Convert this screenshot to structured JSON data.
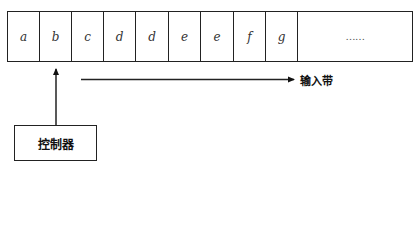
{
  "diagram": {
    "type": "turing-machine-schematic",
    "tape": {
      "label": "输入带",
      "cells": [
        {
          "symbol": "a",
          "width": 32
        },
        {
          "symbol": "b",
          "width": 32
        },
        {
          "symbol": "c",
          "width": 32
        },
        {
          "symbol": "d",
          "width": 32
        },
        {
          "symbol": "d",
          "width": 33
        },
        {
          "symbol": "e",
          "width": 32
        },
        {
          "symbol": "e",
          "width": 33
        },
        {
          "symbol": "f",
          "width": 32
        },
        {
          "symbol": "g",
          "width": 32
        },
        {
          "symbol": "……",
          "width": 116
        }
      ]
    },
    "controller": {
      "label": "控制器",
      "points_to_cell_index": 1
    },
    "arrows": [
      {
        "name": "head-pointer",
        "from": "controller",
        "to": "tape-cell-b",
        "direction": "up"
      },
      {
        "name": "tape-direction",
        "direction": "right",
        "label": "输入带"
      }
    ]
  }
}
